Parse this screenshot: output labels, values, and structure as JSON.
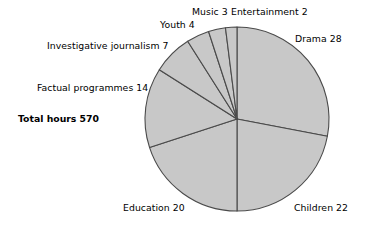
{
  "chart_data": {
    "type": "pie",
    "title": "",
    "total_label": "Total hours 570",
    "total_hours": 570,
    "units": "percent of total hours",
    "start_angle_deg": 0,
    "direction": "clockwise",
    "legend": "labels around perimeter",
    "slice_fill": "#c8c8c8",
    "slice_stroke": "#4a4a4a",
    "categories": [
      "Drama",
      "Children",
      "Education",
      "Factual programmes",
      "Investigative journalism",
      "Youth",
      "Music",
      "Entertainment"
    ],
    "values": [
      28,
      22,
      20,
      14,
      7,
      4,
      3,
      2
    ],
    "labels": [
      "Drama 28",
      "Children 22",
      "Education 20",
      "Factual programmes 14",
      "Investigative journalism 7",
      "Youth 4",
      "Music 3",
      "Entertainment 2"
    ]
  },
  "labels": {
    "drama": "Drama 28",
    "children": "Children 22",
    "education": "Education 20",
    "factual": "Factual programmes 14",
    "investigative": "Investigative journalism 7",
    "youth": "Youth 4",
    "music": "Music 3",
    "entertainment": "Entertainment 2",
    "total": "Total hours 570"
  }
}
